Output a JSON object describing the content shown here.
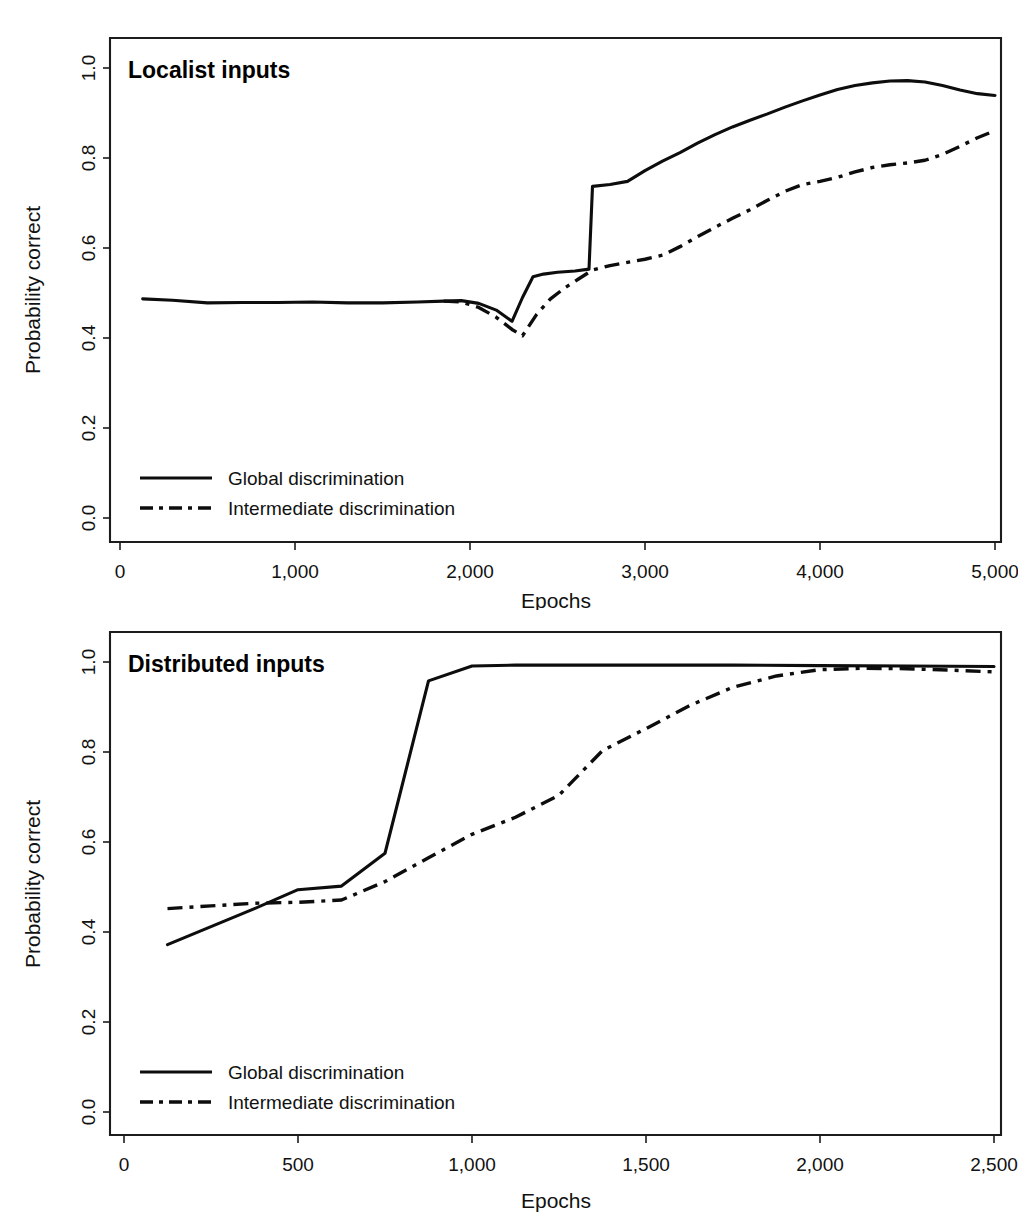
{
  "figure": {
    "background_color": "#ffffff",
    "line_color": "#0d0d0d",
    "panels": [
      {
        "id": "localist",
        "title": "Localist inputs",
        "xlabel": "Epochs",
        "ylabel": "Probability correct",
        "legend": [
          {
            "label": "Global discrimination",
            "style": "solid"
          },
          {
            "label": "Intermediate discrimination",
            "style": "dash-dot"
          }
        ],
        "xticks": [
          "0",
          "1,000",
          "2,000",
          "3,000",
          "4,000",
          "5,000"
        ],
        "yticks": [
          "0.0",
          "0.2",
          "0.4",
          "0.6",
          "0.8",
          "1.0"
        ]
      },
      {
        "id": "distributed",
        "title": "Distributed inputs",
        "xlabel": "Epochs",
        "ylabel": "Probability correct",
        "legend": [
          {
            "label": "Global discrimination",
            "style": "solid"
          },
          {
            "label": "Intermediate discrimination",
            "style": "dash-dot"
          }
        ],
        "xticks": [
          "0",
          "500",
          "1,000",
          "1,500",
          "2,000",
          "2,500"
        ],
        "yticks": [
          "0.0",
          "0.2",
          "0.4",
          "0.6",
          "0.8",
          "1.0"
        ]
      }
    ]
  },
  "chart_data": [
    {
      "type": "line",
      "title": "Localist inputs",
      "xlabel": "Epochs",
      "ylabel": "Probability correct",
      "xlim": [
        0,
        5000
      ],
      "ylim": [
        0.0,
        1.0
      ],
      "xticks": [
        0,
        1000,
        2000,
        3000,
        4000,
        5000
      ],
      "yticks": [
        0.0,
        0.2,
        0.4,
        0.6,
        0.8,
        1.0
      ],
      "grid": false,
      "legend_position": "bottom-left",
      "series": [
        {
          "name": "Global discrimination",
          "style": "solid",
          "x": [
            130,
            300,
            500,
            700,
            900,
            1100,
            1300,
            1500,
            1700,
            1850,
            1950,
            2050,
            2150,
            2240,
            2300,
            2360,
            2420,
            2500,
            2600,
            2680,
            2700,
            2800,
            2900,
            3000,
            3100,
            3200,
            3300,
            3400,
            3500,
            3600,
            3700,
            3800,
            3900,
            4000,
            4100,
            4200,
            4300,
            4400,
            4500,
            4600,
            4700,
            4800,
            4900,
            5000
          ],
          "y": [
            0.487,
            0.484,
            0.478,
            0.479,
            0.479,
            0.48,
            0.478,
            0.478,
            0.48,
            0.482,
            0.483,
            0.477,
            0.462,
            0.437,
            0.49,
            0.536,
            0.542,
            0.546,
            0.549,
            0.553,
            0.737,
            0.741,
            0.748,
            0.772,
            0.793,
            0.812,
            0.833,
            0.852,
            0.869,
            0.884,
            0.898,
            0.913,
            0.927,
            0.94,
            0.952,
            0.961,
            0.967,
            0.971,
            0.972,
            0.969,
            0.961,
            0.951,
            0.943,
            0.939
          ]
        },
        {
          "name": "Intermediate discrimination",
          "style": "dash-dot",
          "x": [
            1850,
            1950,
            2050,
            2150,
            2240,
            2300,
            2380,
            2460,
            2540,
            2620,
            2700,
            2800,
            2900,
            3000,
            3100,
            3200,
            3300,
            3400,
            3500,
            3600,
            3700,
            3800,
            3900,
            4000,
            4100,
            4200,
            4300,
            4400,
            4500,
            4600,
            4700,
            4800,
            4900,
            5000
          ],
          "y": [
            0.482,
            0.48,
            0.468,
            0.446,
            0.419,
            0.405,
            0.452,
            0.487,
            0.511,
            0.531,
            0.551,
            0.561,
            0.568,
            0.575,
            0.584,
            0.603,
            0.625,
            0.646,
            0.666,
            0.685,
            0.706,
            0.726,
            0.741,
            0.748,
            0.757,
            0.769,
            0.779,
            0.785,
            0.789,
            0.795,
            0.808,
            0.826,
            0.845,
            0.861
          ]
        }
      ]
    },
    {
      "type": "line",
      "title": "Distributed inputs",
      "xlabel": "Epochs",
      "ylabel": "Probability correct",
      "xlim": [
        0,
        2500
      ],
      "ylim": [
        0.0,
        1.0
      ],
      "xticks": [
        0,
        500,
        1000,
        1500,
        2000,
        2500
      ],
      "yticks": [
        0.0,
        0.2,
        0.4,
        0.6,
        0.8,
        1.0
      ],
      "grid": false,
      "legend_position": "bottom-left",
      "series": [
        {
          "name": "Global discrimination",
          "style": "solid",
          "x": [
            125,
            250,
            375,
            500,
            625,
            750,
            875,
            1000,
            1125,
            1250,
            1500,
            1750,
            2000,
            2250,
            2500
          ],
          "y": [
            0.372,
            0.412,
            0.452,
            0.494,
            0.502,
            0.575,
            0.958,
            0.991,
            0.993,
            0.993,
            0.993,
            0.993,
            0.992,
            0.991,
            0.99
          ]
        },
        {
          "name": "Intermediate discrimination",
          "style": "dash-dot",
          "x": [
            125,
            250,
            375,
            500,
            625,
            750,
            875,
            1000,
            1125,
            1250,
            1375,
            1500,
            1625,
            1750,
            1875,
            2000,
            2125,
            2250,
            2375,
            2500
          ],
          "y": [
            0.452,
            0.458,
            0.464,
            0.466,
            0.471,
            0.512,
            0.565,
            0.617,
            0.655,
            0.704,
            0.803,
            0.852,
            0.903,
            0.944,
            0.969,
            0.983,
            0.986,
            0.985,
            0.982,
            0.978
          ]
        }
      ]
    }
  ]
}
